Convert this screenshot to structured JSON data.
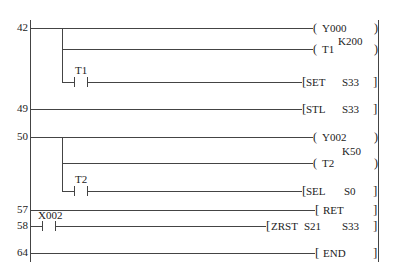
{
  "diagram": {
    "type": "ladder",
    "rungs": [
      {
        "step": "42",
        "outputs": [
          {
            "kind": "coil",
            "operand": "Y000"
          },
          {
            "kind": "coil",
            "operand": "T1",
            "preset": "K200"
          },
          {
            "kind": "instruction",
            "contact": "T1",
            "text": "SET",
            "operand": "S33"
          }
        ]
      },
      {
        "step": "49",
        "outputs": [
          {
            "kind": "instruction",
            "text": "STL",
            "operand": "S33"
          }
        ]
      },
      {
        "step": "50",
        "outputs": [
          {
            "kind": "coil",
            "operand": "Y002"
          },
          {
            "kind": "coil",
            "operand": "T2",
            "preset": "K50"
          },
          {
            "kind": "instruction",
            "contact": "T2",
            "text": "SEL",
            "operand": "S0"
          }
        ]
      },
      {
        "step": "57",
        "outputs": [
          {
            "kind": "instruction",
            "text": "RET"
          }
        ]
      },
      {
        "step": "58",
        "contact": "X002",
        "outputs": [
          {
            "kind": "instruction",
            "text": "ZRST",
            "operand1": "S21",
            "operand2": "S33"
          }
        ]
      },
      {
        "step": "64",
        "outputs": [
          {
            "kind": "instruction",
            "text": "END"
          }
        ]
      }
    ]
  }
}
